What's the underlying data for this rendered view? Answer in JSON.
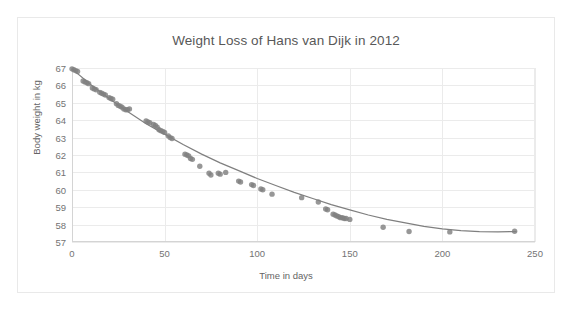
{
  "chart_data": {
    "type": "scatter",
    "title": "Weight Loss of Hans van Dijk in 2012",
    "xlabel": "Time in days",
    "ylabel": "Body weight in kg",
    "xlim": [
      0,
      250
    ],
    "ylim": [
      57,
      67
    ],
    "xticks": [
      0,
      50,
      100,
      150,
      200,
      250
    ],
    "yticks": [
      57,
      58,
      59,
      60,
      61,
      62,
      63,
      64,
      65,
      66,
      67
    ],
    "grid": true,
    "legend": "none",
    "marker_color": "#808080",
    "trendline_color": "#7f7f7f",
    "series": [
      {
        "name": "Body weight measurements",
        "marker": "circle",
        "points": [
          [
            0,
            66.95
          ],
          [
            1,
            66.9
          ],
          [
            2,
            66.85
          ],
          [
            3,
            66.8
          ],
          [
            6,
            66.25
          ],
          [
            7,
            66.2
          ],
          [
            8,
            66.15
          ],
          [
            9,
            66.1
          ],
          [
            11,
            65.85
          ],
          [
            12,
            65.8
          ],
          [
            13,
            65.75
          ],
          [
            15,
            65.6
          ],
          [
            16,
            65.55
          ],
          [
            17,
            65.5
          ],
          [
            18,
            65.45
          ],
          [
            20,
            65.3
          ],
          [
            21,
            65.25
          ],
          [
            22,
            65.2
          ],
          [
            24,
            64.95
          ],
          [
            25,
            64.85
          ],
          [
            26,
            64.8
          ],
          [
            27,
            64.75
          ],
          [
            28,
            64.65
          ],
          [
            29,
            64.6
          ],
          [
            30,
            64.6
          ],
          [
            31,
            64.65
          ],
          [
            40,
            63.95
          ],
          [
            41,
            63.9
          ],
          [
            42,
            63.85
          ],
          [
            44,
            63.75
          ],
          [
            45,
            63.7
          ],
          [
            46,
            63.6
          ],
          [
            47,
            63.45
          ],
          [
            48,
            63.4
          ],
          [
            49,
            63.35
          ],
          [
            50,
            63.3
          ],
          [
            52,
            63.1
          ],
          [
            53,
            63.0
          ],
          [
            54,
            62.95
          ],
          [
            61,
            62.05
          ],
          [
            62,
            62.0
          ],
          [
            63,
            61.95
          ],
          [
            64,
            61.8
          ],
          [
            65,
            61.75
          ],
          [
            69,
            61.35
          ],
          [
            74,
            60.95
          ],
          [
            75,
            60.85
          ],
          [
            79,
            60.95
          ],
          [
            80,
            60.9
          ],
          [
            83,
            61.0
          ],
          [
            90,
            60.5
          ],
          [
            91,
            60.45
          ],
          [
            97,
            60.3
          ],
          [
            98,
            60.25
          ],
          [
            102,
            60.05
          ],
          [
            103,
            60.0
          ],
          [
            108,
            59.75
          ],
          [
            124,
            59.55
          ],
          [
            133,
            59.3
          ],
          [
            137,
            58.9
          ],
          [
            138,
            58.85
          ],
          [
            141,
            58.6
          ],
          [
            142,
            58.55
          ],
          [
            143,
            58.5
          ],
          [
            144,
            58.45
          ],
          [
            145,
            58.4
          ],
          [
            146,
            58.4
          ],
          [
            147,
            58.35
          ],
          [
            148,
            58.35
          ],
          [
            150,
            58.3
          ],
          [
            168,
            57.85
          ],
          [
            182,
            57.6
          ],
          [
            204,
            57.58
          ],
          [
            239,
            57.62
          ]
        ]
      }
    ],
    "trendline": {
      "name": "fitted exponential decay curve",
      "points": [
        [
          0,
          66.95
        ],
        [
          10,
          66.05
        ],
        [
          20,
          65.25
        ],
        [
          30,
          64.5
        ],
        [
          40,
          63.8
        ],
        [
          50,
          63.2
        ],
        [
          60,
          62.6
        ],
        [
          70,
          62.05
        ],
        [
          80,
          61.55
        ],
        [
          90,
          61.1
        ],
        [
          100,
          60.65
        ],
        [
          110,
          60.25
        ],
        [
          120,
          59.85
        ],
        [
          130,
          59.5
        ],
        [
          140,
          59.15
        ],
        [
          150,
          58.85
        ],
        [
          160,
          58.55
        ],
        [
          170,
          58.3
        ],
        [
          180,
          58.1
        ],
        [
          190,
          57.9
        ],
        [
          200,
          57.75
        ],
        [
          210,
          57.65
        ],
        [
          220,
          57.6
        ],
        [
          230,
          57.58
        ],
        [
          240,
          57.6
        ]
      ]
    }
  }
}
